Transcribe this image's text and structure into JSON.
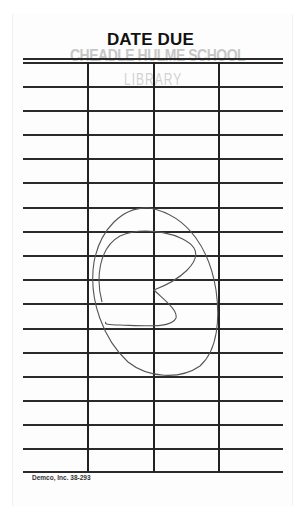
{
  "card": {
    "title": "DATE DUE",
    "stamp": {
      "line1": "CHEADLE HULME SCHOOL",
      "line2": "LIBRARY"
    },
    "footer": "Demco, Inc. 38-293",
    "columns": 4,
    "rows": 16,
    "entries": []
  },
  "colors": {
    "ink": "#222222",
    "stamp": "#bdbdbd",
    "pencil": "#555555"
  }
}
